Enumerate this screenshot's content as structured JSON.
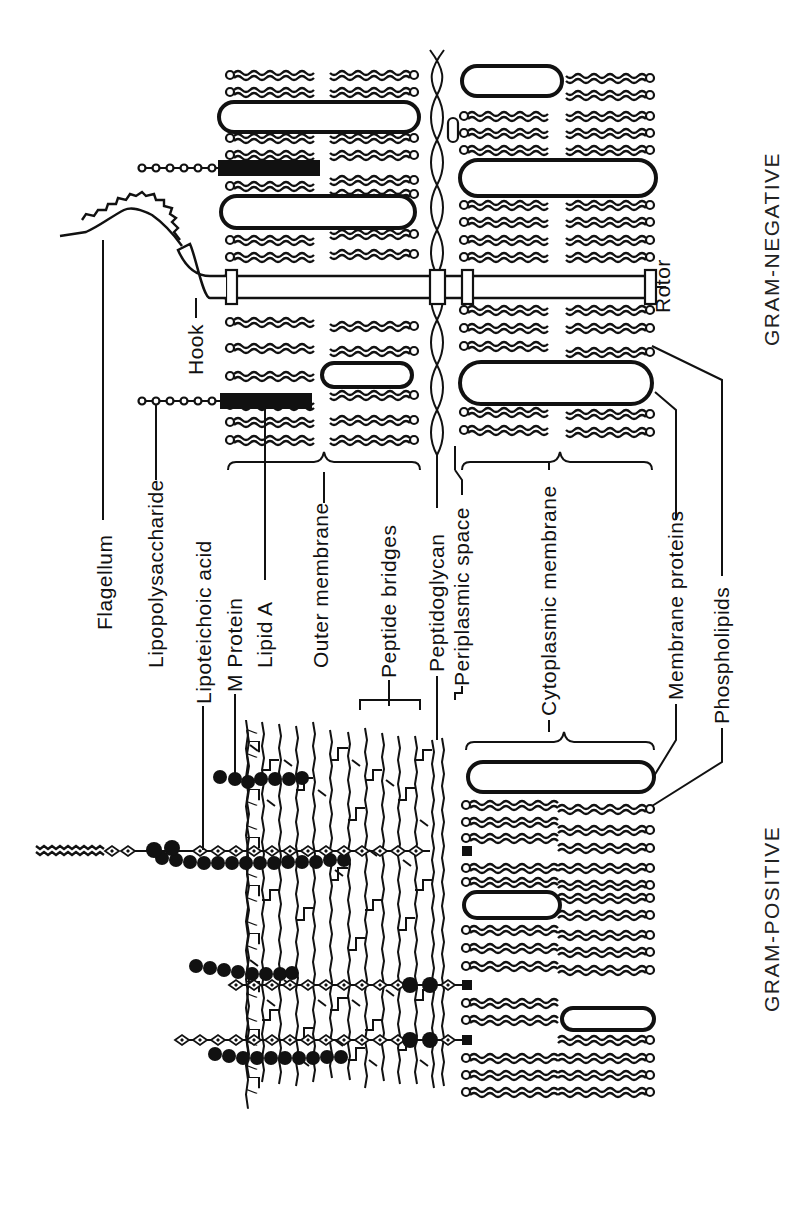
{
  "diagram": {
    "orientation": "rotated-90-ccw",
    "panels": {
      "gram_negative": {
        "title": "GRAM-NEGATIVE"
      },
      "gram_positive": {
        "title": "GRAM-POSITIVE"
      }
    },
    "labels": {
      "flagellum": "Flagellum",
      "hook": "Hook",
      "rotor": "Rotor",
      "lipopolysaccharide": "Lipopolysaccharide",
      "lipoteichoic_acid": "Lipoteichoic acid",
      "m_protein": "M Protein",
      "lipid_a": "Lipid A",
      "outer_membrane": "Outer membrane",
      "peptide_bridges": "Peptide bridges",
      "peptidoglycan": "Peptidoglycan",
      "periplasmic_space": "Periplasmic space",
      "cytoplasmic_membrane": "Cytoplasmic membrane",
      "membrane_proteins": "Membrane proteins",
      "phospholipids": "Phospholipids"
    },
    "colors": {
      "ink": "#111111",
      "background": "#ffffff"
    }
  }
}
